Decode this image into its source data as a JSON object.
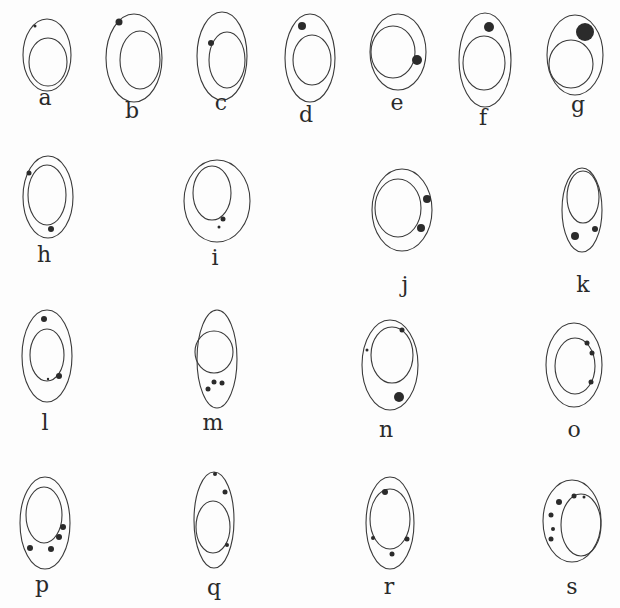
{
  "figure": {
    "type": "scientific-plate",
    "ink_color": "#3a3a3a",
    "background": "#fdfdfd"
  },
  "cells": [
    {
      "label": "a",
      "cx": 47,
      "cy": 55,
      "rx": 24,
      "ry": 36,
      "ncx": 48,
      "ncy": 62,
      "nrx": 19,
      "nry": 24,
      "label_x": 45,
      "label_y": 105,
      "granules": [
        {
          "x": 35,
          "y": 26,
          "r": 1.5
        }
      ]
    },
    {
      "label": "b",
      "cx": 134,
      "cy": 58,
      "rx": 28,
      "ry": 44,
      "ncx": 140,
      "ncy": 60,
      "nrx": 20,
      "nry": 29,
      "label_x": 132,
      "label_y": 118,
      "granules": [
        {
          "x": 119,
          "y": 22,
          "r": 3.5
        }
      ]
    },
    {
      "label": "c",
      "cx": 222,
      "cy": 56,
      "rx": 25,
      "ry": 44,
      "ncx": 227,
      "ncy": 60,
      "nrx": 18,
      "nry": 28,
      "label_x": 221,
      "label_y": 110,
      "granules": [
        {
          "x": 211,
          "y": 43,
          "r": 3
        }
      ]
    },
    {
      "label": "d",
      "cx": 310,
      "cy": 58,
      "rx": 25,
      "ry": 44,
      "ncx": 312,
      "ncy": 60,
      "nrx": 19,
      "nry": 25,
      "label_x": 306,
      "label_y": 122,
      "granules": [
        {
          "x": 302,
          "y": 26,
          "r": 4
        }
      ]
    },
    {
      "label": "e",
      "cx": 398,
      "cy": 52,
      "rx": 28,
      "ry": 38,
      "ncx": 393,
      "ncy": 52,
      "nrx": 22,
      "nry": 26,
      "label_x": 397,
      "label_y": 110,
      "granules": [
        {
          "x": 417,
          "y": 60,
          "r": 5
        }
      ]
    },
    {
      "label": "f",
      "cx": 485,
      "cy": 60,
      "rx": 26,
      "ry": 47,
      "ncx": 484,
      "ncy": 63,
      "nrx": 21,
      "nry": 27,
      "label_x": 483,
      "label_y": 125,
      "granules": [
        {
          "x": 489,
          "y": 27,
          "r": 5
        }
      ]
    },
    {
      "label": "g",
      "cx": 575,
      "cy": 55,
      "rx": 28,
      "ry": 40,
      "ncx": 571,
      "ncy": 64,
      "nrx": 22,
      "nry": 24,
      "label_x": 578,
      "label_y": 112,
      "granules": [
        {
          "x": 585,
          "y": 32,
          "r": 9
        }
      ]
    },
    {
      "label": "h",
      "cx": 48,
      "cy": 197,
      "rx": 25,
      "ry": 41,
      "ncx": 47,
      "ncy": 195,
      "nrx": 19,
      "nry": 30,
      "label_x": 44,
      "label_y": 262,
      "granules": [
        {
          "x": 29,
          "y": 173,
          "r": 2.5
        },
        {
          "x": 51,
          "y": 229,
          "r": 3
        }
      ]
    },
    {
      "label": "i",
      "cx": 217,
      "cy": 201,
      "rx": 33,
      "ry": 41,
      "ncx": 212,
      "ncy": 193,
      "nrx": 19,
      "nry": 27,
      "label_x": 215,
      "label_y": 265,
      "granules": [
        {
          "x": 223,
          "y": 219,
          "r": 2.5
        },
        {
          "x": 219,
          "y": 227,
          "r": 1.5
        }
      ]
    },
    {
      "label": "j",
      "cx": 402,
      "cy": 210,
      "rx": 30,
      "ry": 41,
      "ncx": 398,
      "ncy": 208,
      "nrx": 23,
      "nry": 29,
      "label_x": 405,
      "label_y": 292,
      "granules": [
        {
          "x": 427,
          "y": 199,
          "r": 4
        },
        {
          "x": 421,
          "y": 228,
          "r": 4
        }
      ]
    },
    {
      "label": "k",
      "cx": 582,
      "cy": 210,
      "rx": 20,
      "ry": 42,
      "ncx": 583,
      "ncy": 197,
      "nrx": 16,
      "nry": 26,
      "label_x": 583,
      "label_y": 292,
      "granules": [
        {
          "x": 575,
          "y": 236,
          "r": 4
        },
        {
          "x": 595,
          "y": 229,
          "r": 3
        }
      ]
    },
    {
      "label": "l",
      "cx": 47,
      "cy": 356,
      "rx": 25,
      "ry": 46,
      "ncx": 47,
      "ncy": 355,
      "nrx": 17,
      "nry": 26,
      "label_x": 45,
      "label_y": 430,
      "granules": [
        {
          "x": 44,
          "y": 319,
          "r": 3
        },
        {
          "x": 59,
          "y": 376,
          "r": 3
        },
        {
          "x": 48,
          "y": 379,
          "r": 1.2
        }
      ]
    },
    {
      "label": "m",
      "cx": 217,
      "cy": 359,
      "rx": 20,
      "ry": 49,
      "ncx": 214,
      "ncy": 352,
      "nrx": 19,
      "nry": 21,
      "label_x": 213,
      "label_y": 430,
      "granules": [
        {
          "x": 214,
          "y": 382,
          "r": 2.5
        },
        {
          "x": 222,
          "y": 383,
          "r": 2.5
        },
        {
          "x": 208,
          "y": 389,
          "r": 2.5
        }
      ]
    },
    {
      "label": "n",
      "cx": 390,
      "cy": 365,
      "rx": 28,
      "ry": 45,
      "ncx": 392,
      "ncy": 355,
      "nrx": 21,
      "nry": 28,
      "label_x": 386,
      "label_y": 437,
      "granules": [
        {
          "x": 402,
          "y": 330,
          "r": 2.5
        },
        {
          "x": 399,
          "y": 397,
          "r": 5
        },
        {
          "x": 367,
          "y": 350,
          "r": 1.5
        }
      ]
    },
    {
      "label": "o",
      "cx": 574,
      "cy": 365,
      "rx": 28,
      "ry": 42,
      "ncx": 575,
      "ncy": 366,
      "nrx": 20,
      "nry": 28,
      "label_x": 574,
      "label_y": 437,
      "granules": [
        {
          "x": 587,
          "y": 343,
          "r": 2.5
        },
        {
          "x": 592,
          "y": 353,
          "r": 2.5
        },
        {
          "x": 591,
          "y": 382,
          "r": 2.5
        }
      ]
    },
    {
      "label": "p",
      "cx": 45,
      "cy": 523,
      "rx": 25,
      "ry": 46,
      "ncx": 44,
      "ncy": 515,
      "nrx": 18,
      "nry": 28,
      "label_x": 42,
      "label_y": 592,
      "granules": [
        {
          "x": 63,
          "y": 527,
          "r": 3
        },
        {
          "x": 59,
          "y": 537,
          "r": 3
        },
        {
          "x": 30,
          "y": 548,
          "r": 3
        },
        {
          "x": 51,
          "y": 549,
          "r": 3
        }
      ]
    },
    {
      "label": "q",
      "cx": 214,
      "cy": 520,
      "rx": 20,
      "ry": 48,
      "ncx": 213,
      "ncy": 527,
      "nrx": 17,
      "nry": 26,
      "label_x": 214,
      "label_y": 595,
      "granules": [
        {
          "x": 215,
          "y": 474,
          "r": 2
        },
        {
          "x": 225,
          "y": 492,
          "r": 2.5
        },
        {
          "x": 227,
          "y": 545,
          "r": 2
        }
      ]
    },
    {
      "label": "r",
      "cx": 390,
      "cy": 523,
      "rx": 24,
      "ry": 46,
      "ncx": 390,
      "ncy": 519,
      "nrx": 20,
      "nry": 30,
      "label_x": 389,
      "label_y": 594,
      "granules": [
        {
          "x": 385,
          "y": 492,
          "r": 3
        },
        {
          "x": 373,
          "y": 538,
          "r": 2
        },
        {
          "x": 407,
          "y": 539,
          "r": 2.5
        },
        {
          "x": 392,
          "y": 554,
          "r": 2.5
        }
      ]
    },
    {
      "label": "s",
      "cx": 572,
      "cy": 521,
      "rx": 29,
      "ry": 41,
      "ncx": 581,
      "ncy": 525,
      "nrx": 20,
      "nry": 31,
      "label_x": 572,
      "label_y": 594,
      "granules": [
        {
          "x": 559,
          "y": 502,
          "r": 3
        },
        {
          "x": 551,
          "y": 515,
          "r": 2.5
        },
        {
          "x": 553,
          "y": 529,
          "r": 2
        },
        {
          "x": 551,
          "y": 539,
          "r": 2.5
        },
        {
          "x": 574,
          "y": 496,
          "r": 2.5
        },
        {
          "x": 584,
          "y": 497,
          "r": 1.5
        }
      ]
    }
  ]
}
